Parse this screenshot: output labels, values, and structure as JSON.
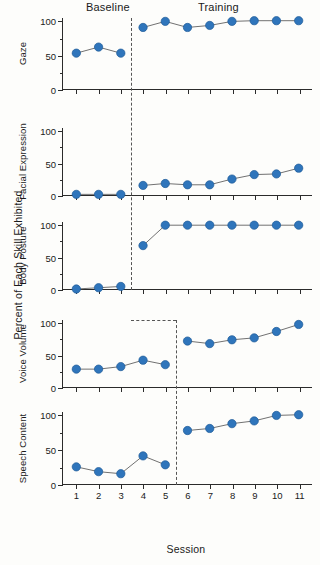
{
  "figure": {
    "axis_title_y": "Percent of Each Skill Exhibited",
    "axis_title_x": "Session",
    "phase_baseline": "Baseline",
    "phase_training": "Training",
    "marker_color": "#2f75bb",
    "line_color": "#6f6f6f",
    "axis_color": "#2b2b2b",
    "phase_line_color": "#555555"
  },
  "x_tick_labels": [
    "1",
    "2",
    "3",
    "4",
    "5",
    "6",
    "7",
    "8",
    "9",
    "10",
    "11"
  ],
  "y_tick_labels": [
    "0",
    "50",
    "100"
  ],
  "chart_data": {
    "type": "line",
    "xlabel": "Session",
    "ylabel": "Percent of Each Skill Exhibited",
    "xlim": [
      0.4,
      11.6
    ],
    "ylim": [
      0,
      105
    ],
    "yticks": [
      0,
      50,
      100
    ],
    "x": [
      1,
      2,
      3,
      4,
      5,
      6,
      7,
      8,
      9,
      10,
      11
    ],
    "grid": false,
    "legend": null,
    "phases": [
      "Baseline",
      "Training"
    ],
    "panels": [
      {
        "name": "Gaze",
        "label": "Gaze",
        "phase_change_x": 3.5,
        "baseline": {
          "x": [
            1,
            2,
            3
          ],
          "values": [
            53,
            62,
            53
          ]
        },
        "training": {
          "x": [
            4,
            5,
            6,
            7,
            8,
            9,
            10,
            11
          ],
          "values": [
            91,
            100,
            91,
            94,
            100,
            101,
            101,
            101
          ]
        }
      },
      {
        "name": "Facial Expression",
        "label": "Facial Expression",
        "phase_change_x": 3.5,
        "baseline": {
          "x": [
            1,
            2,
            3
          ],
          "values": [
            1,
            1,
            1
          ]
        },
        "training": {
          "x": [
            4,
            5,
            6,
            7,
            8,
            9,
            10,
            11
          ],
          "values": [
            15,
            18,
            16,
            16,
            25,
            32,
            33,
            42
          ]
        }
      },
      {
        "name": "Body Posture",
        "label": "Body Posture",
        "phase_change_x": 3.5,
        "baseline": {
          "x": [
            1,
            2,
            3
          ],
          "values": [
            0,
            2,
            4
          ]
        },
        "training": {
          "x": [
            4,
            5,
            6,
            7,
            8,
            9,
            10,
            11
          ],
          "values": [
            68,
            100,
            100,
            100,
            100,
            100,
            100,
            100
          ]
        }
      },
      {
        "name": "Voice Volume",
        "label": "Voice Volume",
        "phase_change_x": 5.5,
        "baseline": {
          "x": [
            1,
            2,
            3,
            4,
            5
          ],
          "values": [
            28,
            28,
            32,
            42,
            35
          ]
        },
        "training": {
          "x": [
            6,
            7,
            8,
            9,
            10,
            11
          ],
          "values": [
            72,
            68,
            74,
            77,
            87,
            98
          ]
        }
      },
      {
        "name": "Speech Content",
        "label": "Speech Content",
        "phase_change_x": 5.5,
        "baseline": {
          "x": [
            1,
            2,
            3,
            4,
            5
          ],
          "values": [
            25,
            18,
            15,
            41,
            28
          ]
        },
        "training": {
          "x": [
            6,
            7,
            8,
            9,
            10,
            11
          ],
          "values": [
            78,
            81,
            88,
            92,
            100,
            101
          ]
        }
      }
    ]
  }
}
